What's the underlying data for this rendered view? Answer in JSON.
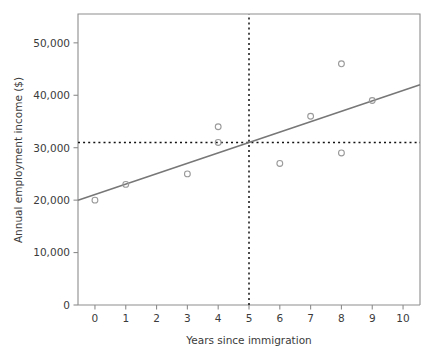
{
  "chart_data": {
    "type": "scatter",
    "title": "",
    "subtitle": "",
    "xlabel": "Years since immigration",
    "ylabel": "Annual employment income ($)",
    "xlim": [
      -0.55,
      10.55
    ],
    "ylim": [
      0,
      55500
    ],
    "grid": false,
    "legend": null,
    "x_ticks": [
      0,
      1,
      2,
      3,
      4,
      5,
      6,
      7,
      8,
      9,
      10
    ],
    "x_tick_labels": [
      "0",
      "1",
      "2",
      "3",
      "4",
      "5",
      "6",
      "7",
      "8",
      "9",
      "10"
    ],
    "y_ticks": [
      0,
      10000,
      20000,
      30000,
      40000,
      50000
    ],
    "y_tick_labels": [
      "0",
      "10,000",
      "20,000",
      "30,000",
      "40,000",
      "50,000"
    ],
    "points": [
      {
        "x": 0,
        "y": 20000
      },
      {
        "x": 1,
        "y": 23000
      },
      {
        "x": 3,
        "y": 25000
      },
      {
        "x": 4,
        "y": 34000
      },
      {
        "x": 4,
        "y": 31000
      },
      {
        "x": 6,
        "y": 27000
      },
      {
        "x": 7,
        "y": 36000
      },
      {
        "x": 8,
        "y": 46000
      },
      {
        "x": 8,
        "y": 29000
      },
      {
        "x": 9,
        "y": 39000
      }
    ],
    "trend_line": {
      "name": "regression line",
      "x_start": -0.55,
      "y_start": 20000,
      "x_end": 10.55,
      "y_end": 42000,
      "intercept": 21090,
      "slope": 1982
    },
    "reference_lines": [
      {
        "name": "mean-x-reference",
        "orientation": "vertical",
        "value": 5
      },
      {
        "name": "mean-y-reference",
        "orientation": "horizontal",
        "value": 31000
      }
    ],
    "colors": {
      "marker_stroke": "#9a9a9a",
      "trend_line": "#777777",
      "reference_line": "#111111",
      "axis": "#8d8d8d",
      "text": "#3b3b3b",
      "background": "#ffffff"
    }
  }
}
